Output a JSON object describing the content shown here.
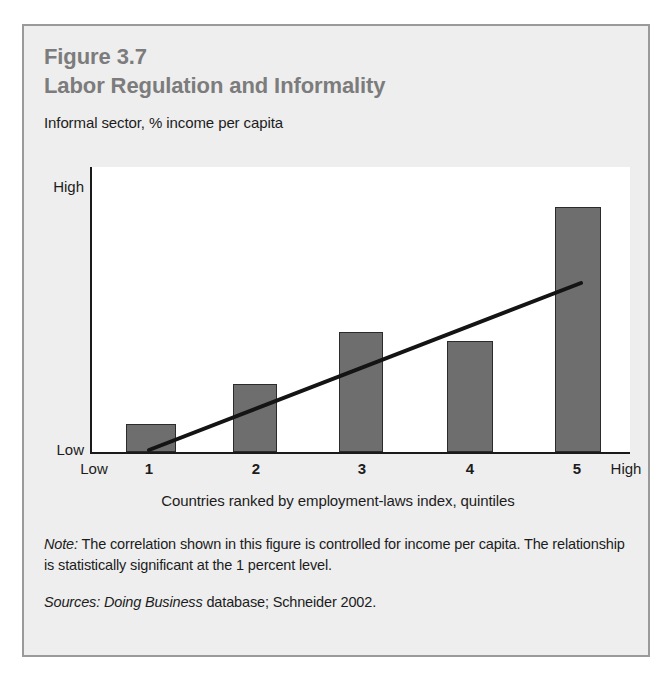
{
  "figure": {
    "number": "Figure 3.7",
    "title": "Labor Regulation and Informality",
    "subtitle": "Informal sector, % income per capita",
    "note_label": "Note:",
    "note_text": " The correlation shown in this figure is controlled for income per capita. The relationship is statistically significant at the 1 percent level.",
    "sources_label": "Sources:",
    "sources_emphasis": " Doing Business",
    "sources_text": " database; Schneider 2002."
  },
  "colors": {
    "panel_background": "#eeeeee",
    "panel_border": "#9a9a9a",
    "title_gray": "#7c7c7c",
    "bar_fill": "#6e6e6e",
    "bar_outline": "#2b2b2b",
    "axis": "#1a1a1a",
    "plot_background": "#ffffff",
    "text": "#1c1c1c"
  },
  "chart_data": {
    "type": "bar",
    "title": "Labor Regulation and Informality",
    "subtitle": "Informal sector, % income per capita",
    "xlabel": "Countries ranked by employment-laws index, quintiles",
    "ylabel": "Informal sector, % income per capita",
    "categories": [
      "1",
      "2",
      "3",
      "4",
      "5"
    ],
    "values": [
      10,
      24,
      42,
      39,
      100
    ],
    "value_units": "relative height, % of tallest bar",
    "ylim": [
      0,
      100
    ],
    "y_tick_labels": [
      "Low",
      "High"
    ],
    "x_axis_end_labels": {
      "left": "Low",
      "right": "High"
    },
    "grid": false,
    "legend": "none",
    "series": [
      {
        "name": "Informal sector",
        "type": "bar",
        "values": [
          10,
          24,
          42,
          39,
          100
        ]
      },
      {
        "name": "Trend line",
        "type": "line",
        "x": [
          1,
          5
        ],
        "values": [
          2,
          60
        ],
        "description": "upward-sloping fitted trend line from quintile 1 to quintile 5"
      }
    ]
  },
  "bars": [
    {
      "label": "1",
      "height_pct": 10,
      "x_pct": 6.3,
      "width_pct": 9.3
    },
    {
      "label": "2",
      "height_pct": 24,
      "x_pct": 26.3,
      "width_pct": 8.1
    },
    {
      "label": "3",
      "height_pct": 42,
      "x_pct": 46.0,
      "width_pct": 8.1
    },
    {
      "label": "4",
      "height_pct": 39,
      "x_pct": 66.0,
      "width_pct": 8.5
    },
    {
      "label": "5",
      "height_pct": 86,
      "x_pct": 86.0,
      "width_pct": 8.7
    }
  ],
  "x_ticks": [
    {
      "label": "Low",
      "left_px": 70,
      "bold": false
    },
    {
      "label": "1",
      "left_px": 125,
      "bold": true
    },
    {
      "label": "2",
      "left_px": 232,
      "bold": true
    },
    {
      "label": "3",
      "left_px": 338,
      "bold": true
    },
    {
      "label": "4",
      "left_px": 446,
      "bold": true
    },
    {
      "label": "5",
      "left_px": 553,
      "bold": true
    },
    {
      "label": "High",
      "left_px": 602,
      "bold": false
    }
  ],
  "y_ticks": {
    "high": "High",
    "low": "Low"
  }
}
